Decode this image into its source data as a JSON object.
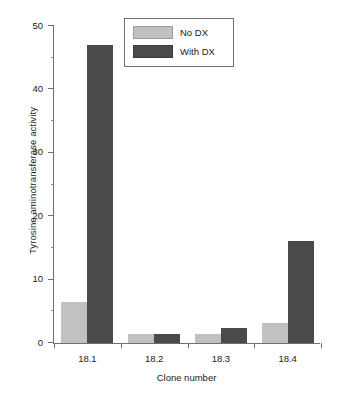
{
  "chart_data": {
    "type": "bar",
    "title": "",
    "xlabel": "Clone number",
    "ylabel": "Tyrosine aminotransferase activity",
    "categories": [
      "18.1",
      "18.2",
      "18.3",
      "18.4"
    ],
    "series": [
      {
        "name": "No DX",
        "color": "#c1c1c1",
        "values": [
          6.5,
          1.4,
          1.5,
          3.2
        ]
      },
      {
        "name": "With DX",
        "color": "#4a4a4a",
        "values": [
          47.0,
          1.4,
          2.4,
          16.1
        ]
      }
    ],
    "ylim": [
      0,
      50
    ],
    "ytick_labels": [
      "0",
      "10",
      "20",
      "30",
      "40",
      "50"
    ],
    "ytick_values": [
      0,
      10,
      20,
      30,
      40,
      50
    ],
    "yminor_values": [
      5,
      15,
      25,
      35,
      45
    ],
    "grid": false,
    "legend_position": "top-right-inside",
    "legend_entries": [
      "No DX",
      "With DX"
    ]
  }
}
